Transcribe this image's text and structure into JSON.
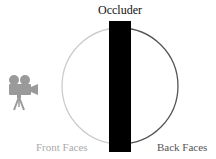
{
  "labels": {
    "occluder": "Occluder",
    "front_faces": "Front Faces",
    "back_faces": "Back Faces"
  },
  "colors": {
    "front_arc": "#cccccc",
    "back_arc": "#555555",
    "occluder": "#000000",
    "camera": "#9a9a9a"
  },
  "icons": [
    "camera-icon"
  ]
}
